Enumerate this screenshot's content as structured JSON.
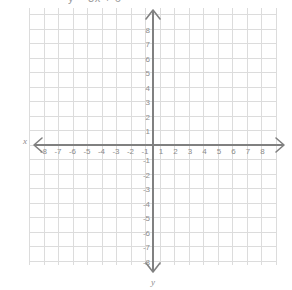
{
  "caption": {
    "text": "y = 3x + 6",
    "note": "cropped at top edge of screenshot"
  },
  "axis_names": {
    "x": "x",
    "y": "y"
  },
  "colors": {
    "background": "#ffffff",
    "grid": "#dcdcdc",
    "axis": "#808080",
    "label": "#8c8c8c"
  },
  "chart_data": {
    "type": "scatter",
    "title": "y = 3x + 6",
    "xlabel": "x",
    "ylabel": "y",
    "grid": true,
    "legend": false,
    "xlim": [
      -8.6,
      8.6
    ],
    "ylim": [
      -8.9,
      8.9
    ],
    "x_ticks": [
      -8,
      -7,
      -6,
      -5,
      -4,
      -3,
      -2,
      -1,
      1,
      2,
      3,
      4,
      5,
      6,
      7,
      8
    ],
    "y_ticks": [
      8,
      7,
      6,
      5,
      4,
      3,
      2,
      1,
      -1,
      -2,
      -3,
      -4,
      -5,
      -6,
      -7,
      -8
    ],
    "x_tick_labels": [
      "-8",
      "-7",
      "-6",
      "-5",
      "-4",
      "-3",
      "-2",
      "-1",
      "1",
      "2",
      "3",
      "4",
      "5",
      "6",
      "7",
      "8"
    ],
    "y_tick_labels": [
      "8",
      "7",
      "6",
      "5",
      "4",
      "3",
      "2",
      "1",
      "-1",
      "-2",
      "-3",
      "-4",
      "-5",
      "-6",
      "-7",
      "-8"
    ],
    "series": [
      {
        "name": "plotted-points",
        "x": [],
        "y": []
      }
    ],
    "annotations": []
  }
}
